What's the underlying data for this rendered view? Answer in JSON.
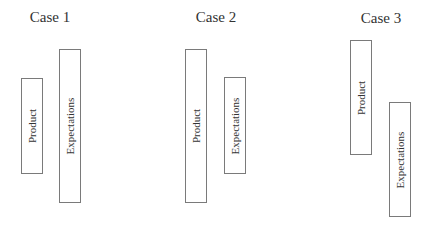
{
  "diagram": {
    "cases": [
      {
        "title": "Case 1",
        "title_pos": {
          "x": 50,
          "y": 8
        },
        "boxes": [
          {
            "label": "Product",
            "x": 21,
            "y": 78,
            "w": 22,
            "h": 96
          },
          {
            "label": "Expectations",
            "x": 59,
            "y": 49,
            "w": 22,
            "h": 154
          }
        ]
      },
      {
        "title": "Case 2",
        "title_pos": {
          "x": 216,
          "y": 8
        },
        "boxes": [
          {
            "label": "Product",
            "x": 185,
            "y": 49,
            "w": 22,
            "h": 154
          },
          {
            "label": "Expectations",
            "x": 224,
            "y": 77,
            "w": 22,
            "h": 97
          }
        ]
      },
      {
        "title": "Case 3",
        "title_pos": {
          "x": 381,
          "y": 9
        },
        "boxes": [
          {
            "label": "Product",
            "x": 350,
            "y": 40,
            "w": 22,
            "h": 115
          },
          {
            "label": "Expectations",
            "x": 389,
            "y": 102,
            "w": 22,
            "h": 115
          }
        ]
      }
    ],
    "colors": {
      "box_border": "#7a7a7a",
      "text": "#333333",
      "background": "#ffffff"
    }
  }
}
